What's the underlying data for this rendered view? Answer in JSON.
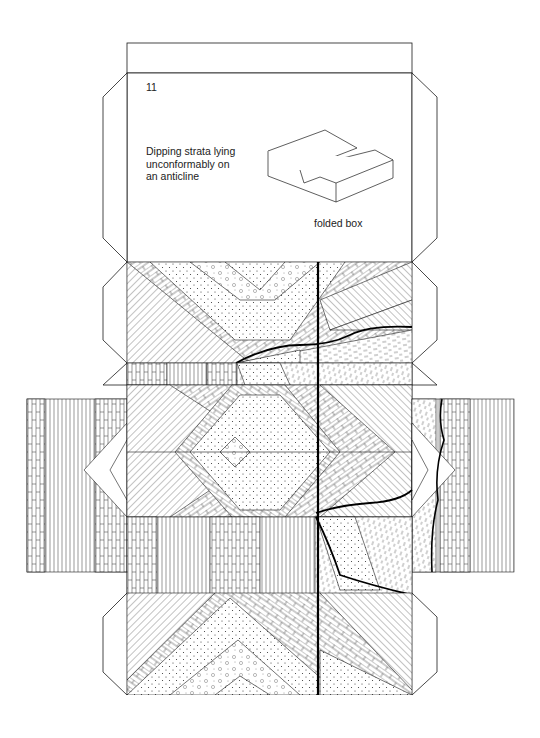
{
  "card": {
    "number": "11",
    "title_lines": [
      "Dipping strata lying",
      "unconformably on",
      "an anticline"
    ],
    "caption": "folded box"
  },
  "legend_patterns": [
    "brick-limestone",
    "vertical-lines",
    "diagonal-lines",
    "dotted-sandstone",
    "pebble-conglomerate",
    "dashed-shale",
    "unconformity-wavy-line",
    "fault-line"
  ],
  "colors": {
    "ink": "#1a1a1a",
    "paper": "#ffffff"
  }
}
